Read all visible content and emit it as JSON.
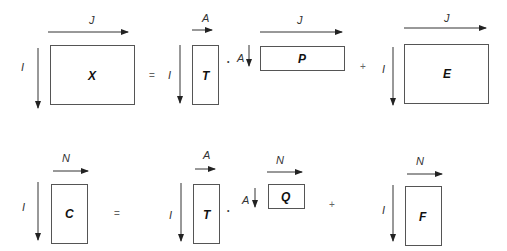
{
  "diagram": {
    "type": "matrix-decomposition",
    "equations": [
      {
        "id": "x-equation",
        "lhs": {
          "matrix": "X",
          "rows": "I",
          "cols": "J"
        },
        "equals": "=",
        "terms": [
          {
            "matrix": "T",
            "rows": "I",
            "cols": "A"
          },
          {
            "operator": "·"
          },
          {
            "matrix": "P",
            "rows": "A",
            "cols": "J"
          },
          {
            "operator": "+"
          },
          {
            "matrix": "E",
            "rows": "I",
            "cols": "J"
          }
        ]
      },
      {
        "id": "c-equation",
        "lhs": {
          "matrix": "C",
          "rows": "I",
          "cols": "N"
        },
        "equals": "=",
        "terms": [
          {
            "matrix": "T",
            "rows": "I",
            "cols": "A"
          },
          {
            "operator": "·"
          },
          {
            "matrix": "Q",
            "rows": "A",
            "cols": "N"
          },
          {
            "operator": "+"
          },
          {
            "matrix": "F",
            "rows": "I",
            "cols": "N"
          }
        ]
      }
    ]
  },
  "labels": {
    "X": "X",
    "T": "T",
    "P": "P",
    "E": "E",
    "C": "C",
    "Q": "Q",
    "F": "F",
    "I": "I",
    "J": "J",
    "A": "A",
    "N": "N",
    "eq": "=",
    "plus": "+",
    "dot": "•"
  }
}
